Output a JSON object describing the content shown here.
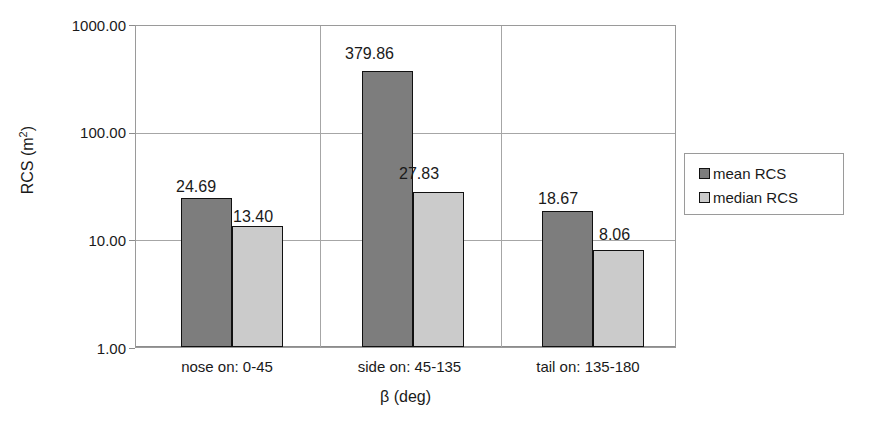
{
  "chart_data": {
    "type": "bar",
    "title": "",
    "xlabel": "β (deg)",
    "ylabel": "RCS (m²)",
    "yscale": "log",
    "ylim": [
      1.0,
      1000.0
    ],
    "ytick_labels": [
      "1000.00",
      "100.00",
      "10.00",
      "1.00"
    ],
    "ytick_values": [
      1000.0,
      100.0,
      10.0,
      1.0
    ],
    "grid": "horizontal-and-vertical",
    "legend_position": "right",
    "categories": [
      "nose on:  0-45",
      "side on: 45-135",
      "tail on: 135-180"
    ],
    "series": [
      {
        "name": "mean RCS",
        "color": "#7d7d7d",
        "values": [
          24.69,
          379.86,
          18.67
        ],
        "labels": [
          "24.69",
          "379.86",
          "18.67"
        ]
      },
      {
        "name": "median RCS",
        "color": "#cbcbcb",
        "values": [
          13.4,
          27.83,
          8.06
        ],
        "labels": [
          "13.40",
          "27.83",
          "8.06"
        ]
      }
    ]
  },
  "axis": {
    "y_title_main": "RCS (m",
    "y_title_sup": "2",
    "y_title_close": ")",
    "x_title": "β (deg)"
  },
  "legend": {
    "items": [
      {
        "label": "mean RCS",
        "color": "#7d7d7d"
      },
      {
        "label": "median RCS",
        "color": "#cbcbcb"
      }
    ]
  }
}
